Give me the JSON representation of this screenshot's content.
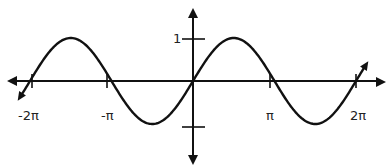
{
  "chart_data": {
    "type": "line",
    "title": "",
    "function": "y = sin(x)",
    "xlabel": "",
    "ylabel": "",
    "xlim": [
      -6.2832,
      6.2832
    ],
    "ylim": [
      -1,
      1
    ],
    "grid": false,
    "legend": null,
    "x_ticks": [
      {
        "value": -6.2832,
        "label": "-2π"
      },
      {
        "value": -3.1416,
        "label": "-π"
      },
      {
        "value": 3.1416,
        "label": "π"
      },
      {
        "value": 6.2832,
        "label": "2π"
      }
    ],
    "y_ticks": [
      {
        "value": 1,
        "label": "1"
      },
      {
        "value": -1,
        "label": ""
      }
    ],
    "series": [
      {
        "name": "sin(x)",
        "x": [
          -6.2832,
          -4.7124,
          -3.1416,
          -1.5708,
          0,
          1.5708,
          3.1416,
          4.7124,
          6.2832
        ],
        "values": [
          0,
          1,
          0,
          -1,
          0,
          1,
          0,
          -1,
          0
        ]
      }
    ],
    "line_color": "#111111"
  },
  "labels": {
    "y_one": "1",
    "x_neg_two_pi": "-2π",
    "x_neg_pi": "-π",
    "x_pi": "π",
    "x_two_pi": "2π"
  }
}
